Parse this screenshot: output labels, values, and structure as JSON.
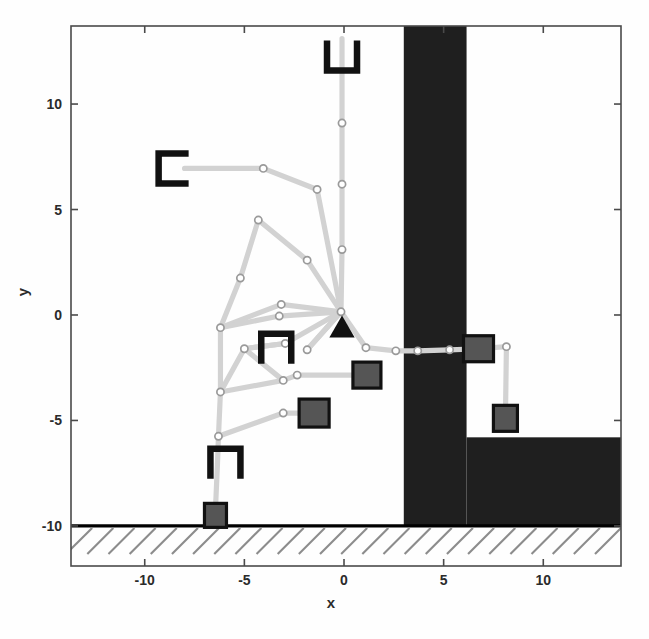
{
  "chart_data": {
    "type": "scatter",
    "title": "",
    "xlabel": "x",
    "ylabel": "y",
    "xlim": [
      -13.7,
      13.9
    ],
    "ylim": [
      -11.9,
      13.7
    ],
    "xticks": [
      -10,
      -5,
      0,
      5,
      10
    ],
    "yticks": [
      10,
      5,
      0,
      -5,
      -10
    ],
    "xtick_labels": [
      "-10",
      "-5",
      "0",
      "5",
      "10"
    ],
    "ytick_labels": [
      "10",
      "5",
      "0",
      "-5",
      "-10"
    ],
    "grid": false,
    "legend": "none",
    "colors": {
      "path": "#d2d2d2",
      "node_edge": "#9a9a9a",
      "node_fill": "#ffffff",
      "obstacle": "#1f1f1f",
      "block_fill": "#555555",
      "block_edge": "#111111",
      "ground": "#000000",
      "hatch": "#8c8c8c",
      "axis": "#4a4a4a",
      "text": "#2b2b2b"
    },
    "ground": {
      "y": -10.0,
      "x_start": -13.7,
      "x_end": 13.9,
      "hatch_count": 26
    },
    "obstacles": [
      {
        "name": "vertical-wall",
        "x": 3.0,
        "y": -10.0,
        "width": 3.15,
        "height": 23.7
      },
      {
        "name": "lower-right-shelf",
        "x": 6.15,
        "y": -10.0,
        "width": 7.75,
        "height": 4.2
      }
    ],
    "series": [
      {
        "name": "trajectory-tree",
        "edges": [
          [
            [
              -0.1,
              13.1
            ],
            [
              -0.1,
              9.1
            ]
          ],
          [
            [
              -0.1,
              9.1
            ],
            [
              -0.1,
              6.2
            ]
          ],
          [
            [
              -0.1,
              6.2
            ],
            [
              -0.1,
              3.1
            ]
          ],
          [
            [
              -0.1,
              3.1
            ],
            [
              -0.15,
              0.15
            ]
          ],
          [
            [
              -8.0,
              6.95
            ],
            [
              -4.05,
              6.95
            ]
          ],
          [
            [
              -4.05,
              6.95
            ],
            [
              -1.35,
              5.95
            ]
          ],
          [
            [
              -1.35,
              5.95
            ],
            [
              -0.15,
              0.15
            ]
          ],
          [
            [
              -4.3,
              4.5
            ],
            [
              -5.2,
              1.75
            ]
          ],
          [
            [
              -4.3,
              4.5
            ],
            [
              -1.85,
              2.6
            ]
          ],
          [
            [
              -1.85,
              2.6
            ],
            [
              -0.15,
              0.15
            ]
          ],
          [
            [
              -5.2,
              1.75
            ],
            [
              -6.2,
              -0.6
            ]
          ],
          [
            [
              -6.2,
              -0.6
            ],
            [
              -6.2,
              -3.65
            ]
          ],
          [
            [
              -6.2,
              -3.65
            ],
            [
              -6.3,
              -5.75
            ]
          ],
          [
            [
              -6.3,
              -5.75
            ],
            [
              -6.35,
              -7.05
            ]
          ],
          [
            [
              -6.35,
              -7.05
            ],
            [
              -6.45,
              -9.2
            ]
          ],
          [
            [
              -6.2,
              -0.6
            ],
            [
              -3.15,
              0.5
            ]
          ],
          [
            [
              -3.15,
              0.5
            ],
            [
              -0.15,
              0.15
            ]
          ],
          [
            [
              -6.2,
              -0.6
            ],
            [
              -3.25,
              -0.05
            ]
          ],
          [
            [
              -3.25,
              -0.05
            ],
            [
              -0.15,
              0.15
            ]
          ],
          [
            [
              -5.0,
              -1.6
            ],
            [
              -2.95,
              -1.35
            ]
          ],
          [
            [
              -2.95,
              -1.35
            ],
            [
              -0.15,
              0.15
            ]
          ],
          [
            [
              -5.0,
              -1.6
            ],
            [
              -3.05,
              -3.1
            ]
          ],
          [
            [
              -3.05,
              -3.1
            ],
            [
              -2.35,
              -2.85
            ]
          ],
          [
            [
              -2.35,
              -2.85
            ],
            [
              1.15,
              -2.85
            ]
          ],
          [
            [
              -5.0,
              -1.6
            ],
            [
              -2.95,
              -1.35
            ]
          ],
          [
            [
              -6.2,
              -3.65
            ],
            [
              -5.0,
              -1.6
            ]
          ],
          [
            [
              -6.2,
              -3.65
            ],
            [
              -3.05,
              -3.1
            ]
          ],
          [
            [
              -3.05,
              -4.65
            ],
            [
              -1.5,
              -4.65
            ]
          ],
          [
            [
              -6.3,
              -5.75
            ],
            [
              -3.05,
              -4.65
            ]
          ],
          [
            [
              -0.15,
              0.15
            ],
            [
              -1.85,
              -1.65
            ]
          ],
          [
            [
              -1.85,
              -1.65
            ],
            [
              -0.15,
              0.15
            ]
          ],
          [
            [
              -0.15,
              0.15
            ],
            [
              1.1,
              -1.55
            ]
          ],
          [
            [
              1.1,
              -1.55
            ],
            [
              2.6,
              -1.7
            ]
          ],
          [
            [
              2.6,
              -1.7
            ],
            [
              3.7,
              -1.7
            ]
          ],
          [
            [
              3.7,
              -1.7
            ],
            [
              5.3,
              -1.65
            ]
          ],
          [
            [
              5.3,
              -1.65
            ],
            [
              6.75,
              -1.6
            ]
          ],
          [
            [
              6.75,
              -1.6
            ],
            [
              8.15,
              -1.5
            ]
          ],
          [
            [
              8.15,
              -1.5
            ],
            [
              8.1,
              -4.9
            ]
          ]
        ],
        "nodes": [
          [
            -0.1,
            9.1
          ],
          [
            -0.1,
            6.2
          ],
          [
            -0.1,
            3.1
          ],
          [
            -4.05,
            6.95
          ],
          [
            -1.35,
            5.95
          ],
          [
            -4.3,
            4.5
          ],
          [
            -1.85,
            2.6
          ],
          [
            -5.2,
            1.75
          ],
          [
            -6.2,
            -0.6
          ],
          [
            -3.15,
            0.5
          ],
          [
            -3.25,
            -0.05
          ],
          [
            -5.0,
            -1.6
          ],
          [
            -2.95,
            -1.35
          ],
          [
            -1.85,
            -1.65
          ],
          [
            1.1,
            -1.55
          ],
          [
            2.6,
            -1.7
          ],
          [
            3.7,
            -1.7
          ],
          [
            5.3,
            -1.65
          ],
          [
            8.15,
            -1.5
          ],
          [
            -2.35,
            -2.85
          ],
          [
            -3.05,
            -3.1
          ],
          [
            -6.2,
            -3.65
          ],
          [
            -3.05,
            -4.65
          ],
          [
            -6.3,
            -5.75
          ],
          [
            -0.15,
            0.15
          ]
        ]
      }
    ],
    "markers": [
      {
        "name": "goal-triangle",
        "shape": "triangle",
        "x": -0.1,
        "y": -0.55,
        "size": 22
      },
      {
        "name": "block-ground",
        "shape": "square",
        "x": -6.45,
        "y": -9.5,
        "w": 22,
        "h": 24
      },
      {
        "name": "block-lower-left",
        "shape": "square",
        "x": -1.5,
        "y": -4.65,
        "w": 30,
        "h": 28
      },
      {
        "name": "block-center",
        "shape": "square",
        "x": 1.15,
        "y": -2.85,
        "w": 28,
        "h": 26
      },
      {
        "name": "block-right-upper",
        "shape": "square",
        "x": 6.75,
        "y": -1.6,
        "w": 30,
        "h": 26
      },
      {
        "name": "block-right-lower",
        "shape": "square",
        "x": 8.1,
        "y": -4.9,
        "w": 24,
        "h": 26
      }
    ],
    "grippers": [
      {
        "name": "gripper-top",
        "x": -0.1,
        "y": 12.3,
        "rotation": 0,
        "size": 30
      },
      {
        "name": "gripper-left",
        "x": -8.55,
        "y": 6.95,
        "rotation": 90,
        "size": 30
      },
      {
        "name": "gripper-mid",
        "x": -3.4,
        "y": -1.6,
        "rotation": 180,
        "size": 30
      },
      {
        "name": "gripper-lower",
        "x": -5.95,
        "y": -7.05,
        "rotation": 180,
        "size": 30
      }
    ]
  }
}
